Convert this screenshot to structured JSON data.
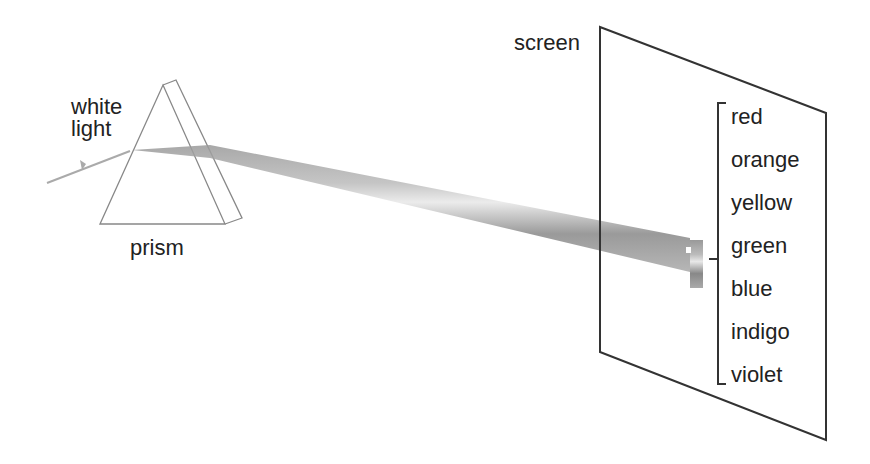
{
  "labels": {
    "white_light": [
      "white",
      "light"
    ],
    "prism": "prism",
    "screen": "screen"
  },
  "spectrum": [
    "red",
    "orange",
    "yellow",
    "green",
    "blue",
    "indigo",
    "violet"
  ],
  "colors": {
    "line": "#333333",
    "prism_line": "#888888",
    "beam": "#888888"
  }
}
